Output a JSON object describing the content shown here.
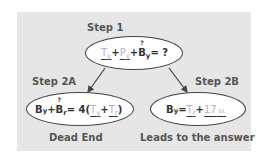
{
  "diagram": {
    "step1": {
      "label": "Step 1",
      "equation": {
        "t": "T",
        "t_sub": "y",
        "plus1": " + ",
        "p": "P",
        "p_sub": "y",
        "plus2": " + ",
        "b": "B",
        "b_sub": "y",
        "rest": " = ?",
        "question_mark": "?"
      }
    },
    "step2a": {
      "label": "Step 2A",
      "equation": {
        "b1": "B",
        "b1_sub": "y",
        "plus1": " + ",
        "b2": "B",
        "b2_sub": "r",
        "mid": " = 4(",
        "t1": "T",
        "t1_sub": "y",
        "plus2": " + ",
        "t2": "T",
        "t2_sub": "r",
        "end": ")",
        "question_mark": "?"
      },
      "caption": "Dead End"
    },
    "step2b": {
      "label": "Step 2B",
      "equation": {
        "b": "B",
        "b_sub": "y",
        "eq": " = ",
        "t": "T",
        "t_sub": "r",
        "plus": "+ ",
        "num": "17",
        "unit": " bl."
      },
      "caption": "Leads to the answer"
    },
    "colors": {
      "panel": "#e6e6e6",
      "faded": "#b4aecb",
      "label": "#555555",
      "outline": "#444444"
    }
  }
}
